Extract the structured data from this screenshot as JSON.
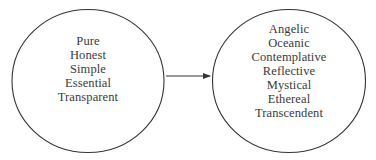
{
  "diagram": {
    "type": "concept-transformation",
    "line_color": "#333333",
    "text_color": "#3a3a3a",
    "left_node": {
      "shape": "ellipse",
      "items": [
        "Pure",
        "Honest",
        "Simple",
        "Essential",
        "Transparent"
      ]
    },
    "arrow": {
      "direction": "left-to-right",
      "from": "left_node",
      "to": "right_node"
    },
    "right_node": {
      "shape": "ellipse",
      "items": [
        "Angelic",
        "Oceanic",
        "Contemplative",
        "Reflective",
        "Mystical",
        "Ethereal",
        "Transcendent"
      ]
    }
  }
}
